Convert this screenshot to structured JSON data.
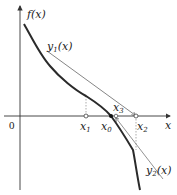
{
  "diagram": {
    "type": "newton-method-iteration-illustration",
    "axes": {
      "x_label": "x",
      "y_label": "f(x)",
      "origin_label": "0"
    },
    "curves": [
      {
        "name": "f",
        "label": "f(x)",
        "style": "thick-solid",
        "color": "#2a2a2a"
      },
      {
        "name": "y1",
        "label_main": "y",
        "label_sub": "1",
        "label_arg": "(x)",
        "style": "thin-solid",
        "color": "#555555"
      },
      {
        "name": "y2",
        "label_main": "y",
        "label_sub": "2",
        "label_arg": "(x)",
        "style": "thin-solid",
        "color": "#555555"
      }
    ],
    "points": [
      {
        "name": "x1",
        "label_main": "x",
        "label_sub": "1"
      },
      {
        "name": "x0",
        "label_main": "x",
        "label_sub": "0"
      },
      {
        "name": "x3",
        "label_main": "x",
        "label_sub": "3"
      },
      {
        "name": "x2",
        "label_main": "x",
        "label_sub": "2"
      }
    ],
    "colors": {
      "axis": "#333333",
      "curve": "#2a2a2a",
      "tangent": "#666666",
      "dotted": "#888888",
      "background": "#ffffff"
    }
  }
}
